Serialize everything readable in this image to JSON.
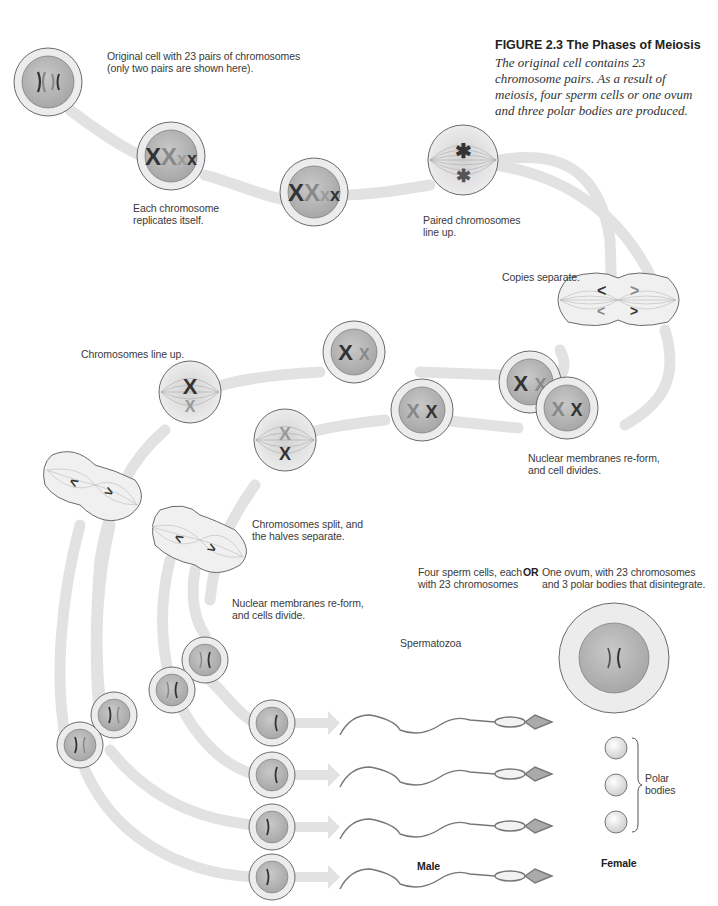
{
  "figure": {
    "title": "FIGURE 2.3 The Phases of Meiosis",
    "caption": "The original cell contains 23 chromosome pairs. As a result of meiosis, four sperm cells or one ovum and three polar bodies are produced."
  },
  "labels": {
    "original_cell": "Original cell with 23 pairs of chromosomes",
    "original_cell_note": "(only two pairs are shown here).",
    "replicates_1": "Each chromosome",
    "replicates_2": "replicates itself.",
    "paired_1": "Paired chromosomes",
    "paired_2": "line up.",
    "copies_separate": "Copies separate.",
    "nuclear_reform_1": "Nuclear membranes re-form,",
    "nuclear_reform_2": "and cell divides.",
    "chromosomes_line_up": "Chromosomes line up.",
    "split_1": "Chromosomes split, and",
    "split_2": "the halves separate.",
    "cells_divide_1": "Nuclear membranes re-form,",
    "cells_divide_2": "and cells divide.",
    "spermatozoa": "Spermatozoa",
    "four_sperm_1": "Four sperm cells, each",
    "four_sperm_2": "with 23 chromosomes",
    "or": "OR",
    "ovum_1": "One ovum, with 23 chromosomes",
    "ovum_2": "and 3 polar bodies that disintegrate.",
    "polar_1": "Polar",
    "polar_2": "bodies",
    "male": "Male",
    "female": "Female"
  },
  "colors": {
    "pathway": "#e2e2e2",
    "cell_outer": "#eeeeee",
    "cell_inner": "#b8b8b8",
    "outline": "#6a6a6a",
    "chromosome_dark": "#333333",
    "chromosome_light": "#8a8a8a"
  }
}
